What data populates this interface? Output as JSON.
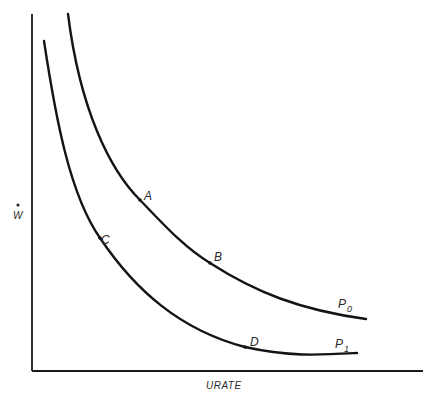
{
  "diagram": {
    "type": "indifference-style curves (wage inflation vs unemployment rate)",
    "axes": {
      "x_label": "URATE",
      "y_label": "W",
      "y_label_dot": "•"
    },
    "curves": [
      {
        "id": "P0",
        "label_main": "P",
        "label_sub": "0",
        "points": [
          "A",
          "B"
        ]
      },
      {
        "id": "P1",
        "label_main": "P",
        "label_sub": "1",
        "points": [
          "C",
          "D"
        ]
      }
    ],
    "points": {
      "A": "A",
      "B": "B",
      "C": "C",
      "D": "D"
    },
    "colors": {
      "line": "#141414",
      "text": "#2a2a2a",
      "background": "#ffffff"
    }
  }
}
